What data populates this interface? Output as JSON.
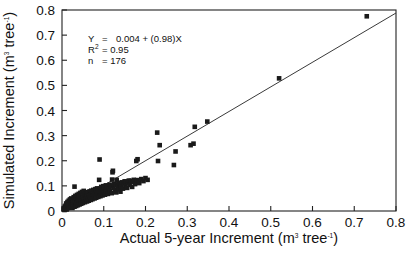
{
  "chart_data": {
    "type": "scatter",
    "title": "",
    "xlabel": "Actual 5-year Increment (m3 tree-1)",
    "ylabel": "Simulated Increment (m3 tree-1)",
    "xlabel_parts": {
      "main": "Actual 5-year Increment (m",
      "sup1": "3",
      "mid": " tree",
      "sup2": "-1",
      "end": ")"
    },
    "ylabel_parts": {
      "main": "Simulated Increment (m",
      "sup1": "3",
      "mid": " tree",
      "sup2": "-1",
      "end": ")"
    },
    "xlim": [
      0,
      0.8
    ],
    "ylim": [
      0,
      0.8
    ],
    "xticks": [
      0,
      0.1,
      0.2,
      0.3,
      0.4,
      0.5,
      0.6,
      0.7,
      0.8
    ],
    "yticks": [
      0,
      0.1,
      0.2,
      0.3,
      0.4,
      0.5,
      0.6,
      0.7,
      0.8
    ],
    "xticklabels": [
      "0",
      "0.1",
      "0.2",
      "0.3",
      "0.4",
      "0.5",
      "0.6",
      "0.7",
      "0.8"
    ],
    "yticklabels": [
      "0",
      "0.1",
      "0.2",
      "0.3",
      "0.4",
      "0.5",
      "0.6",
      "0.7",
      "0.8"
    ],
    "grid": false,
    "legend": null,
    "marker": {
      "shape": "square",
      "color": "#1a1a1a",
      "size_px": 4.6
    },
    "fit_line": {
      "intercept": 0.004,
      "slope": 0.98,
      "color": "#3a3a3a",
      "x_start": 0.0,
      "x_end": 0.8
    },
    "annotation": {
      "equation_label": "Y",
      "equation_eq": "=",
      "equation_rhs": "0.004 + (0.98)X",
      "r2_label": "R",
      "r2_sup": "2",
      "r2_eq": "= 0.95",
      "n_label": "n",
      "n_eq": "= 176"
    },
    "n_points": 176,
    "points": [
      [
        0.004,
        0.006
      ],
      [
        0.005,
        0.012
      ],
      [
        0.006,
        0.004
      ],
      [
        0.007,
        0.018
      ],
      [
        0.008,
        0.009
      ],
      [
        0.009,
        0.022
      ],
      [
        0.01,
        0.014
      ],
      [
        0.01,
        0.03
      ],
      [
        0.011,
        0.006
      ],
      [
        0.012,
        0.026
      ],
      [
        0.013,
        0.017
      ],
      [
        0.013,
        0.036
      ],
      [
        0.014,
        0.011
      ],
      [
        0.015,
        0.029
      ],
      [
        0.016,
        0.021
      ],
      [
        0.016,
        0.041
      ],
      [
        0.017,
        0.013
      ],
      [
        0.018,
        0.033
      ],
      [
        0.018,
        0.024
      ],
      [
        0.019,
        0.046
      ],
      [
        0.02,
        0.016
      ],
      [
        0.02,
        0.036
      ],
      [
        0.021,
        0.027
      ],
      [
        0.022,
        0.05
      ],
      [
        0.023,
        0.019
      ],
      [
        0.023,
        0.04
      ],
      [
        0.024,
        0.031
      ],
      [
        0.025,
        0.012
      ],
      [
        0.026,
        0.044
      ],
      [
        0.026,
        0.023
      ],
      [
        0.027,
        0.035
      ],
      [
        0.028,
        0.055
      ],
      [
        0.029,
        0.026
      ],
      [
        0.03,
        0.047
      ],
      [
        0.03,
        0.017
      ],
      [
        0.031,
        0.038
      ],
      [
        0.032,
        0.06
      ],
      [
        0.033,
        0.029
      ],
      [
        0.033,
        0.05
      ],
      [
        0.034,
        0.02
      ],
      [
        0.035,
        0.041
      ],
      [
        0.036,
        0.064
      ],
      [
        0.03,
        0.097
      ],
      [
        0.036,
        0.032
      ],
      [
        0.037,
        0.053
      ],
      [
        0.038,
        0.023
      ],
      [
        0.039,
        0.044
      ],
      [
        0.04,
        0.068
      ],
      [
        0.04,
        0.035
      ],
      [
        0.041,
        0.056
      ],
      [
        0.042,
        0.026
      ],
      [
        0.043,
        0.047
      ],
      [
        0.044,
        0.072
      ],
      [
        0.045,
        0.038
      ],
      [
        0.045,
        0.059
      ],
      [
        0.046,
        0.029
      ],
      [
        0.047,
        0.05
      ],
      [
        0.048,
        0.076
      ],
      [
        0.049,
        0.041
      ],
      [
        0.05,
        0.062
      ],
      [
        0.05,
        0.032
      ],
      [
        0.051,
        0.053
      ],
      [
        0.052,
        0.08
      ],
      [
        0.053,
        0.044
      ],
      [
        0.054,
        0.065
      ],
      [
        0.055,
        0.035
      ],
      [
        0.056,
        0.056
      ],
      [
        0.057,
        0.07
      ],
      [
        0.058,
        0.047
      ],
      [
        0.059,
        0.068
      ],
      [
        0.06,
        0.038
      ],
      [
        0.06,
        0.059
      ],
      [
        0.061,
        0.075
      ],
      [
        0.062,
        0.05
      ],
      [
        0.063,
        0.071
      ],
      [
        0.064,
        0.041
      ],
      [
        0.065,
        0.062
      ],
      [
        0.066,
        0.078
      ],
      [
        0.067,
        0.053
      ],
      [
        0.068,
        0.074
      ],
      [
        0.069,
        0.044
      ],
      [
        0.07,
        0.065
      ],
      [
        0.07,
        0.081
      ],
      [
        0.071,
        0.056
      ],
      [
        0.072,
        0.077
      ],
      [
        0.073,
        0.047
      ],
      [
        0.074,
        0.068
      ],
      [
        0.075,
        0.084
      ],
      [
        0.076,
        0.059
      ],
      [
        0.077,
        0.08
      ],
      [
        0.078,
        0.05
      ],
      [
        0.079,
        0.071
      ],
      [
        0.08,
        0.087
      ],
      [
        0.08,
        0.062
      ],
      [
        0.081,
        0.083
      ],
      [
        0.082,
        0.053
      ],
      [
        0.083,
        0.074
      ],
      [
        0.084,
        0.09
      ],
      [
        0.085,
        0.065
      ],
      [
        0.086,
        0.086
      ],
      [
        0.087,
        0.056
      ],
      [
        0.088,
        0.077
      ],
      [
        0.089,
        0.124
      ],
      [
        0.09,
        0.068
      ],
      [
        0.09,
        0.205
      ],
      [
        0.091,
        0.089
      ],
      [
        0.092,
        0.059
      ],
      [
        0.093,
        0.08
      ],
      [
        0.094,
        0.096
      ],
      [
        0.095,
        0.071
      ],
      [
        0.096,
        0.092
      ],
      [
        0.097,
        0.062
      ],
      [
        0.098,
        0.083
      ],
      [
        0.099,
        0.099
      ],
      [
        0.1,
        0.074
      ],
      [
        0.101,
        0.095
      ],
      [
        0.103,
        0.065
      ],
      [
        0.104,
        0.086
      ],
      [
        0.105,
        0.102
      ],
      [
        0.106,
        0.077
      ],
      [
        0.108,
        0.098
      ],
      [
        0.11,
        0.068
      ],
      [
        0.112,
        0.089
      ],
      [
        0.114,
        0.105
      ],
      [
        0.115,
        0.08
      ],
      [
        0.117,
        0.101
      ],
      [
        0.119,
        0.071
      ],
      [
        0.12,
        0.125
      ],
      [
        0.121,
        0.154
      ],
      [
        0.122,
        0.16
      ],
      [
        0.123,
        0.092
      ],
      [
        0.125,
        0.108
      ],
      [
        0.127,
        0.083
      ],
      [
        0.129,
        0.104
      ],
      [
        0.13,
        0.074
      ],
      [
        0.131,
        0.124
      ],
      [
        0.133,
        0.095
      ],
      [
        0.135,
        0.111
      ],
      [
        0.136,
        0.086
      ],
      [
        0.138,
        0.107
      ],
      [
        0.14,
        0.077
      ],
      [
        0.141,
        0.112
      ],
      [
        0.142,
        0.098
      ],
      [
        0.144,
        0.114
      ],
      [
        0.146,
        0.089
      ],
      [
        0.148,
        0.11
      ],
      [
        0.15,
        0.118
      ],
      [
        0.152,
        0.101
      ],
      [
        0.154,
        0.117
      ],
      [
        0.156,
        0.092
      ],
      [
        0.158,
        0.113
      ],
      [
        0.16,
        0.121
      ],
      [
        0.162,
        0.104
      ],
      [
        0.165,
        0.12
      ],
      [
        0.168,
        0.096
      ],
      [
        0.17,
        0.116
      ],
      [
        0.172,
        0.124
      ],
      [
        0.175,
        0.107
      ],
      [
        0.178,
        0.199
      ],
      [
        0.18,
        0.123
      ],
      [
        0.181,
        0.206
      ],
      [
        0.185,
        0.111
      ],
      [
        0.19,
        0.127
      ],
      [
        0.195,
        0.119
      ],
      [
        0.2,
        0.131
      ],
      [
        0.205,
        0.124
      ],
      [
        0.228,
        0.312
      ],
      [
        0.23,
        0.199
      ],
      [
        0.234,
        0.262
      ],
      [
        0.268,
        0.183
      ],
      [
        0.272,
        0.237
      ],
      [
        0.308,
        0.262
      ],
      [
        0.315,
        0.268
      ],
      [
        0.318,
        0.335
      ],
      [
        0.348,
        0.356
      ],
      [
        0.52,
        0.528
      ],
      [
        0.73,
        0.775
      ]
    ]
  }
}
